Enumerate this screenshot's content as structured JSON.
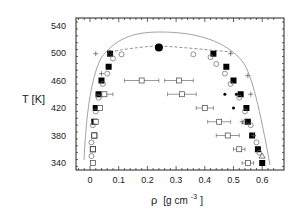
{
  "chart_data": {
    "type": "scatter",
    "title": "",
    "xlabel": "ρ [g cm⁻³]",
    "ylabel": "T [K]",
    "xlabel_main": "ρ",
    "xlabel_unit": "[g cm",
    "xlabel_exp": "-3",
    "xlabel_close": "]",
    "xlim": [
      -0.05,
      0.65
    ],
    "ylim": [
      330,
      545
    ],
    "xticks": [
      "0",
      "0.1",
      "0.2",
      "0.3",
      "0.4",
      "0.5",
      "0.6"
    ],
    "yticks": [
      "340",
      "380",
      "420",
      "460",
      "500",
      "540"
    ],
    "grid": false,
    "legend": null,
    "critical_point": {
      "x": 0.24,
      "y": 508
    },
    "series": [
      {
        "name": "filled squares",
        "marker": "filled-square",
        "points": [
          [
            0.07,
            499
          ],
          [
            0.065,
            480
          ],
          [
            0.04,
            460
          ],
          [
            0.03,
            440
          ],
          [
            0.02,
            420
          ],
          [
            0.015,
            400
          ],
          [
            0.015,
            380
          ],
          [
            0.01,
            360
          ],
          [
            0.43,
            499
          ],
          [
            0.475,
            480
          ],
          [
            0.5,
            460
          ],
          [
            0.525,
            440
          ],
          [
            0.545,
            420
          ],
          [
            0.55,
            400
          ],
          [
            0.565,
            380
          ],
          [
            0.585,
            360
          ],
          [
            0.6,
            340
          ]
        ]
      },
      {
        "name": "open squares with error bars",
        "marker": "open-square",
        "points": [
          [
            0.18,
            460,
            0.06
          ],
          [
            0.05,
            440,
            0.03
          ],
          [
            0.035,
            420,
            0
          ],
          [
            0.02,
            400,
            0
          ],
          [
            0.015,
            380,
            0
          ],
          [
            0.01,
            360,
            0
          ],
          [
            0.01,
            340,
            0
          ],
          [
            0.31,
            460,
            0.05
          ],
          [
            0.32,
            440,
            0.05
          ],
          [
            0.4,
            420,
            0.03
          ],
          [
            0.45,
            400,
            0.04
          ],
          [
            0.48,
            380,
            0.04
          ],
          [
            0.52,
            360,
            0.02
          ],
          [
            0.55,
            340,
            0.02
          ]
        ]
      },
      {
        "name": "open circles",
        "marker": "open-circle",
        "points": [
          [
            0.08,
            492
          ],
          [
            0.06,
            470
          ],
          [
            0.045,
            455
          ],
          [
            0.03,
            435
          ],
          [
            0.02,
            415
          ],
          [
            0.01,
            395
          ],
          [
            0.005,
            370
          ],
          [
            0.005,
            350
          ],
          [
            0.11,
            498
          ],
          [
            0.36,
            498
          ],
          [
            0.42,
            494
          ],
          [
            0.44,
            484
          ],
          [
            0.47,
            470
          ],
          [
            0.49,
            455
          ],
          [
            0.52,
            435
          ],
          [
            0.54,
            415
          ],
          [
            0.56,
            395
          ],
          [
            0.58,
            370
          ],
          [
            0.59,
            355
          ]
        ]
      },
      {
        "name": "crosses",
        "marker": "plus",
        "points": [
          [
            0.02,
            499
          ],
          [
            0.04,
            470
          ],
          [
            0.49,
            499
          ],
          [
            0.55,
            467
          ],
          [
            0.56,
            440
          ],
          [
            0.53,
            400
          ],
          [
            0.57,
            380
          ]
        ]
      },
      {
        "name": "small filled dots",
        "marker": "small-dot",
        "points": [
          [
            0.47,
            440
          ],
          [
            0.51,
            440
          ],
          [
            0.5,
            420
          ]
        ]
      },
      {
        "name": "open triangles",
        "marker": "open-triangle",
        "points": [
          [
            0.07,
            500
          ],
          [
            0.54,
            400
          ],
          [
            0.6,
            350
          ]
        ]
      }
    ],
    "curves": [
      {
        "name": "solid coexistence curve",
        "style": "solid"
      },
      {
        "name": "dashed curve",
        "style": "dashed"
      }
    ]
  }
}
